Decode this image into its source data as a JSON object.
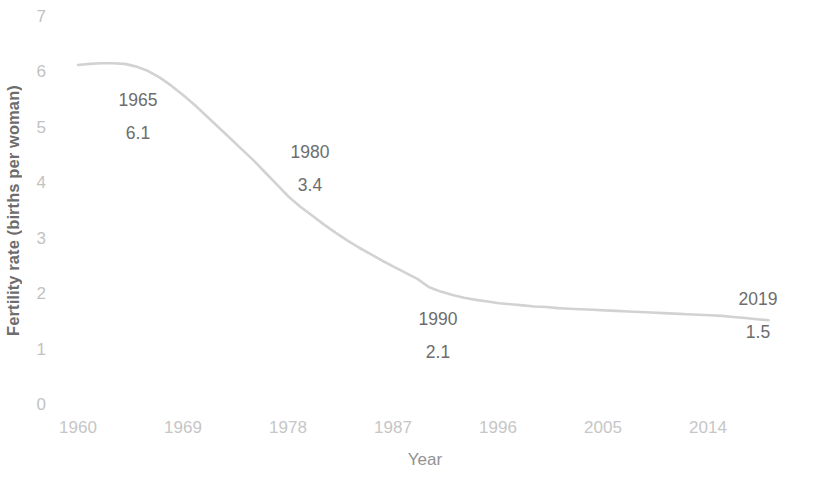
{
  "chart_data": {
    "type": "line",
    "title": "",
    "xlabel": "Year",
    "ylabel": "Fertility rate (births per woman)",
    "xlim": [
      1960,
      2019
    ],
    "ylim": [
      0,
      7
    ],
    "grid": false,
    "legend": "none",
    "line_color": "#d2d2d2",
    "xticks": [
      "1960",
      "1969",
      "1978",
      "1987",
      "1996",
      "2005",
      "2014"
    ],
    "yticks": [
      "0",
      "1",
      "2",
      "3",
      "4",
      "5",
      "6",
      "7"
    ],
    "series": [
      {
        "name": "Fertility rate",
        "x": [
          1960,
          1961,
          1962,
          1963,
          1964,
          1965,
          1966,
          1967,
          1968,
          1969,
          1970,
          1971,
          1972,
          1973,
          1974,
          1975,
          1976,
          1977,
          1978,
          1979,
          1980,
          1981,
          1982,
          1983,
          1984,
          1985,
          1986,
          1987,
          1988,
          1989,
          1990,
          1991,
          1992,
          1993,
          1994,
          1995,
          1996,
          1997,
          1998,
          1999,
          2000,
          2001,
          2002,
          2003,
          2004,
          2005,
          2006,
          2007,
          2008,
          2009,
          2010,
          2011,
          2012,
          2013,
          2014,
          2015,
          2016,
          2017,
          2018,
          2019
        ],
        "values": [
          6.13,
          6.15,
          6.16,
          6.16,
          6.15,
          6.1,
          6.02,
          5.9,
          5.75,
          5.58,
          5.4,
          5.2,
          5.0,
          4.8,
          4.6,
          4.4,
          4.18,
          3.96,
          3.74,
          3.56,
          3.4,
          3.24,
          3.09,
          2.95,
          2.82,
          2.7,
          2.58,
          2.47,
          2.36,
          2.25,
          2.1,
          2.02,
          1.96,
          1.91,
          1.87,
          1.84,
          1.81,
          1.79,
          1.77,
          1.75,
          1.74,
          1.72,
          1.71,
          1.7,
          1.69,
          1.68,
          1.67,
          1.66,
          1.65,
          1.64,
          1.63,
          1.62,
          1.61,
          1.6,
          1.59,
          1.58,
          1.56,
          1.54,
          1.52,
          1.5
        ]
      }
    ],
    "annotations": [
      {
        "year": "1965",
        "value": "6.1"
      },
      {
        "year": "1980",
        "value": "3.4"
      },
      {
        "year": "1990",
        "value": "2.1"
      },
      {
        "year": "2019",
        "value": "1.5"
      }
    ]
  }
}
